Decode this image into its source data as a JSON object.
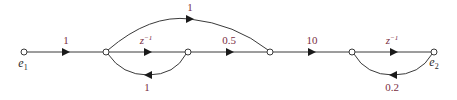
{
  "diagram": {
    "type": "signal-flow-graph",
    "colors": {
      "edge": "#3a3a3a",
      "arrow": "#1a1a1a",
      "gain_label": "#7a2e3f",
      "signal_label": "#2a2a2a"
    },
    "signals": {
      "input": {
        "base": "e",
        "sub": "1"
      },
      "output": {
        "base": "e",
        "sub": "2"
      }
    },
    "nodes": [
      {
        "id": "n1",
        "x": 24,
        "y": 52,
        "label": "e1"
      },
      {
        "id": "n2",
        "x": 106,
        "y": 52
      },
      {
        "id": "n3",
        "x": 188,
        "y": 52
      },
      {
        "id": "n4",
        "x": 270,
        "y": 52
      },
      {
        "id": "n5",
        "x": 352,
        "y": 52
      },
      {
        "id": "n6",
        "x": 434,
        "y": 52,
        "label": "e2"
      }
    ],
    "edges": [
      {
        "from": "n1",
        "to": "n2",
        "gain": "1",
        "kind": "forward"
      },
      {
        "from": "n2",
        "to": "n4",
        "gain": "1",
        "kind": "forward-arc-over"
      },
      {
        "from": "n2",
        "to": "n3",
        "gain_base": "z",
        "gain_sup": "−1",
        "kind": "forward"
      },
      {
        "from": "n3",
        "to": "n2",
        "gain": "1",
        "kind": "feedback-arc-under"
      },
      {
        "from": "n3",
        "to": "n4",
        "gain": "0.5",
        "kind": "forward"
      },
      {
        "from": "n4",
        "to": "n5",
        "gain": "10",
        "kind": "forward"
      },
      {
        "from": "n5",
        "to": "n6",
        "gain_base": "z",
        "gain_sup": "−1",
        "kind": "forward"
      },
      {
        "from": "n6",
        "to": "n5",
        "gain": "0.2",
        "kind": "feedback-arc-under"
      }
    ],
    "labels": {
      "e1_base": "e",
      "e1_sub": "1",
      "e2_base": "e",
      "e2_sub": "2",
      "g_n1_n2": "1",
      "g_n2_n4_arc": "1",
      "g_n2_n3_base": "z",
      "g_n2_n3_sup": "−1",
      "g_n3_n2_fb": "1",
      "g_n3_n4": "0.5",
      "g_n4_n5": "10",
      "g_n5_n6_base": "z",
      "g_n5_n6_sup": "−1",
      "g_n6_n5_fb": "0.2"
    }
  }
}
